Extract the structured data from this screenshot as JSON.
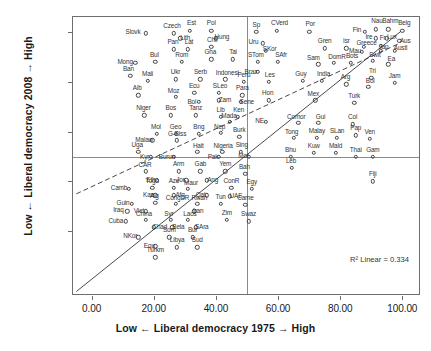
{
  "chart_data": {
    "type": "scatter",
    "title": "",
    "xlabel": "Low ← Liberal democracy 1975 → High",
    "ylabel": "Low ← Liberal democracy 2008 → High",
    "xlim": [
      -6,
      106
    ],
    "ylim": [
      -6,
      106
    ],
    "xticks": [
      "0.00",
      "20.00",
      "40.00",
      "60.00",
      "80.00",
      "100.00"
    ],
    "xtick_values": [
      0,
      20,
      40,
      60,
      80,
      100
    ],
    "yticks": [
      "20.00",
      "40.00",
      "60.00",
      "80.00",
      "100.00"
    ],
    "ytick_values": [
      20,
      40,
      60,
      80,
      100
    ],
    "grid": false,
    "legend": false,
    "annotation": "R² Linear = 0.334",
    "reference_lines": {
      "vertical_x": 50,
      "horizontal_y": 50
    },
    "fit_lines": [
      {
        "name": "identity-line",
        "style": "solid",
        "x1": -5,
        "y1": -5,
        "x2": 100,
        "y2": 100
      },
      {
        "name": "regression-line",
        "style": "dashed",
        "x1": -5,
        "y1": 34.5,
        "x2": 100,
        "y2": 95.5
      }
    ],
    "points": [
      {
        "label": "Slovk",
        "x": 17.5,
        "y": 99.5
      },
      {
        "label": "Czech",
        "x": 26.5,
        "y": 99.5
      },
      {
        "label": "Est",
        "x": 31.5,
        "y": 100.5
      },
      {
        "label": "Lith",
        "x": 28.5,
        "y": 97.5
      },
      {
        "label": "Pol",
        "x": 38.5,
        "y": 100.5
      },
      {
        "label": "Hung",
        "x": 40.0,
        "y": 97.5
      },
      {
        "label": "Sp",
        "x": 53.0,
        "y": 100.0
      },
      {
        "label": "CVerd",
        "x": 59.5,
        "y": 100.5
      },
      {
        "label": "Por",
        "x": 70.0,
        "y": 100.0
      },
      {
        "label": "Fin",
        "x": 88.0,
        "y": 100.0
      },
      {
        "label": "Nau",
        "x": 91.5,
        "y": 101.0
      },
      {
        "label": "Bahm",
        "x": 95.5,
        "y": 101.0
      },
      {
        "label": "Belg",
        "x": 100.0,
        "y": 100.5
      },
      {
        "label": "Ire",
        "x": 91.5,
        "y": 97.5
      },
      {
        "label": "Lux",
        "x": 95.0,
        "y": 97.5
      },
      {
        "label": "Aus",
        "x": 99.0,
        "y": 96.5
      },
      {
        "label": "Uru",
        "x": 55.0,
        "y": 95.5
      },
      {
        "label": "Pan",
        "x": 26.5,
        "y": 93.0
      },
      {
        "label": "Lat",
        "x": 31.0,
        "y": 93.0
      },
      {
        "label": "Chil",
        "x": 38.5,
        "y": 94.0
      },
      {
        "label": "SKor",
        "x": 56.0,
        "y": 92.5
      },
      {
        "label": "Gren",
        "x": 75.0,
        "y": 93.5
      },
      {
        "label": "Isr",
        "x": 82.0,
        "y": 93.5
      },
      {
        "label": "Greece",
        "x": 87.5,
        "y": 94.0
      },
      {
        "label": "Fr",
        "x": 93.0,
        "y": 94.5
      },
      {
        "label": "Mau",
        "x": 87.0,
        "y": 92.0
      },
      {
        "label": "Jap",
        "x": 93.0,
        "y": 92.5
      },
      {
        "label": "Austl",
        "x": 97.5,
        "y": 92.5
      },
      {
        "label": "Mong",
        "x": 14.0,
        "y": 87.5
      },
      {
        "label": "Bul",
        "x": 20.5,
        "y": 88.0
      },
      {
        "label": "Rom",
        "x": 29.0,
        "y": 88.0
      },
      {
        "label": "Gha",
        "x": 38.5,
        "y": 89.0
      },
      {
        "label": "Tai",
        "x": 45.5,
        "y": 89.0
      },
      {
        "label": "STom",
        "x": 53.5,
        "y": 88.0
      },
      {
        "label": "SAfr",
        "x": 60.0,
        "y": 88.0
      },
      {
        "label": "Sam",
        "x": 73.0,
        "y": 87.0
      },
      {
        "label": "DomR",
        "x": 78.0,
        "y": 87.5
      },
      {
        "label": "Bots",
        "x": 83.5,
        "y": 87.5
      },
      {
        "label": "Swit",
        "x": 90.5,
        "y": 88.5
      },
      {
        "label": "Ea",
        "x": 95.5,
        "y": 87.0
      },
      {
        "label": "Ban",
        "x": 12.5,
        "y": 82.5
      },
      {
        "label": "Mali",
        "x": 18.0,
        "y": 80.5
      },
      {
        "label": "Ukr",
        "x": 27.0,
        "y": 81.0
      },
      {
        "label": "Serb",
        "x": 35.0,
        "y": 81.0
      },
      {
        "label": "Indonesi",
        "x": 43.0,
        "y": 81.0
      },
      {
        "label": "Braz",
        "x": 53.5,
        "y": 84.0
      },
      {
        "label": "Peru",
        "x": 49.0,
        "y": 80.0
      },
      {
        "label": "Les",
        "x": 57.0,
        "y": 80.0
      },
      {
        "label": "Guy",
        "x": 68.0,
        "y": 80.5
      },
      {
        "label": "India",
        "x": 74.0,
        "y": 80.5
      },
      {
        "label": "Arg",
        "x": 82.0,
        "y": 79.0
      },
      {
        "label": "Bol",
        "x": 89.0,
        "y": 78.0
      },
      {
        "label": "Tri",
        "x": 90.0,
        "y": 81.5
      },
      {
        "label": "Jam",
        "x": 97.5,
        "y": 79.5
      },
      {
        "label": "Alb",
        "x": 15.0,
        "y": 74.5
      },
      {
        "label": "Moz",
        "x": 27.0,
        "y": 74.0
      },
      {
        "label": "Ecu",
        "x": 33.0,
        "y": 75.5
      },
      {
        "label": "SLeo",
        "x": 41.0,
        "y": 75.5
      },
      {
        "label": "Para",
        "x": 48.5,
        "y": 74.5
      },
      {
        "label": "Bol2",
        "x": 34.5,
        "y": 72.0
      },
      {
        "label": "Zam",
        "x": 41.0,
        "y": 72.5
      },
      {
        "label": "Sene",
        "x": 48.0,
        "y": 72.0
      },
      {
        "label": "Hon",
        "x": 57.0,
        "y": 72.5
      },
      {
        "label": "Mex",
        "x": 72.0,
        "y": 72.5
      },
      {
        "label": "Turk",
        "x": 84.5,
        "y": 71.5
      },
      {
        "label": "Niger",
        "x": 17.0,
        "y": 66.5
      },
      {
        "label": "Bos",
        "x": 25.5,
        "y": 66.5
      },
      {
        "label": "Tanz",
        "x": 33.5,
        "y": 66.5
      },
      {
        "label": "Lib",
        "x": 41.5,
        "y": 66.0
      },
      {
        "label": "Ken",
        "x": 47.0,
        "y": 66.0
      },
      {
        "label": "Mada",
        "x": 44.5,
        "y": 64.0
      },
      {
        "label": "NE",
        "x": 56.0,
        "y": 64.0
      },
      {
        "label": "Comor",
        "x": 66.5,
        "y": 63.5
      },
      {
        "label": "Gui",
        "x": 73.0,
        "y": 63.5
      },
      {
        "label": "Col",
        "x": 84.0,
        "y": 63.0
      },
      {
        "label": "Mol",
        "x": 21.0,
        "y": 59.0
      },
      {
        "label": "Geo",
        "x": 27.0,
        "y": 59.0
      },
      {
        "label": "Bng",
        "x": 34.5,
        "y": 59.0
      },
      {
        "label": "Nep",
        "x": 41.5,
        "y": 59.5
      },
      {
        "label": "Burk",
        "x": 47.5,
        "y": 58.0
      },
      {
        "label": "Malaw",
        "x": 19.5,
        "y": 56.5
      },
      {
        "label": "G-Biss",
        "x": 27.5,
        "y": 56.5
      },
      {
        "label": "Tong",
        "x": 65.0,
        "y": 57.5
      },
      {
        "label": "Malay",
        "x": 72.5,
        "y": 57.5
      },
      {
        "label": "SLan",
        "x": 79.0,
        "y": 57.5
      },
      {
        "label": "Ven",
        "x": 89.5,
        "y": 57.0
      },
      {
        "label": "Pap",
        "x": 85.0,
        "y": 58.5
      },
      {
        "label": "Uga",
        "x": 15.0,
        "y": 52.0
      },
      {
        "label": "Hait",
        "x": 34.0,
        "y": 52.0
      },
      {
        "label": "Nigeria",
        "x": 42.0,
        "y": 52.0
      },
      {
        "label": "Sing",
        "x": 48.0,
        "y": 52.0
      },
      {
        "label": "Kyr",
        "x": 19.0,
        "y": 50.0
      },
      {
        "label": "Burun",
        "x": 26.5,
        "y": 50.0
      },
      {
        "label": "Pak",
        "x": 41.0,
        "y": 50.0
      },
      {
        "label": "Mor",
        "x": 50.5,
        "y": 50.0
      },
      {
        "label": "Bhu",
        "x": 64.0,
        "y": 50.0
      },
      {
        "label": "Kuw",
        "x": 71.5,
        "y": 51.5
      },
      {
        "label": "Mald",
        "x": 78.5,
        "y": 51.5
      },
      {
        "label": "Thai",
        "x": 85.0,
        "y": 50.0
      },
      {
        "label": "Gam",
        "x": 90.5,
        "y": 50.0
      },
      {
        "label": "CAR",
        "x": 17.5,
        "y": 44.0
      },
      {
        "label": "Arm",
        "x": 28.0,
        "y": 44.0
      },
      {
        "label": "Gab",
        "x": 35.0,
        "y": 44.0
      },
      {
        "label": "Yem",
        "x": 43.0,
        "y": 44.0
      },
      {
        "label": "Bah",
        "x": 49.5,
        "y": 43.0
      },
      {
        "label": "Leb",
        "x": 64.5,
        "y": 45.5
      },
      {
        "label": "Eth",
        "x": 21.0,
        "y": 40.5
      },
      {
        "label": "Jor",
        "x": 30.5,
        "y": 40.5
      },
      {
        "label": "Ang",
        "x": 37.0,
        "y": 40.5
      },
      {
        "label": "Fiji",
        "x": 90.5,
        "y": 40.0
      },
      {
        "label": "Camb",
        "x": 12.0,
        "y": 37.0
      },
      {
        "label": "Togo",
        "x": 19.5,
        "y": 37.5
      },
      {
        "label": "Aze",
        "x": 26.5,
        "y": 37.5
      },
      {
        "label": "Maur",
        "x": 31.0,
        "y": 37.0
      },
      {
        "label": "ConR",
        "x": 45.0,
        "y": 37.5
      },
      {
        "label": "Egy",
        "x": 51.5,
        "y": 37.0
      },
      {
        "label": "Kaz",
        "x": 20.5,
        "y": 34.5
      },
      {
        "label": "Afg",
        "x": 26.5,
        "y": 34.5
      },
      {
        "label": "Qat",
        "x": 37.0,
        "y": 34.5
      },
      {
        "label": "UAE",
        "x": 44.5,
        "y": 34.0
      },
      {
        "label": "Guin",
        "x": 13.0,
        "y": 31.0
      },
      {
        "label": "Alg",
        "x": 20.5,
        "y": 31.5
      },
      {
        "label": "CongDR",
        "x": 27.0,
        "y": 31.0
      },
      {
        "label": "Rwan",
        "x": 34.0,
        "y": 31.0
      },
      {
        "label": "Tun",
        "x": 41.5,
        "y": 31.0
      },
      {
        "label": "Came",
        "x": 49.5,
        "y": 30.5
      },
      {
        "label": "Iraq",
        "x": 11.5,
        "y": 28.0
      },
      {
        "label": "Viet",
        "x": 17.5,
        "y": 28.0
      },
      {
        "label": "Iran",
        "x": 33.0,
        "y": 28.0
      },
      {
        "label": "Cuba",
        "x": 11.0,
        "y": 24.0
      },
      {
        "label": "China",
        "x": 17.5,
        "y": 24.5
      },
      {
        "label": "Syr",
        "x": 25.5,
        "y": 24.5
      },
      {
        "label": "Laos",
        "x": 31.0,
        "y": 24.5
      },
      {
        "label": "Zim",
        "x": 43.5,
        "y": 24.5
      },
      {
        "label": "Swaz",
        "x": 50.5,
        "y": 24.0
      },
      {
        "label": "Chad",
        "x": 20.0,
        "y": 21.5
      },
      {
        "label": "Bela",
        "x": 26.0,
        "y": 21.5
      },
      {
        "label": "SAra",
        "x": 33.5,
        "y": 21.5
      },
      {
        "label": "NKor",
        "x": 15.0,
        "y": 17.5
      },
      {
        "label": "Som",
        "x": 25.0,
        "y": 17.5
      },
      {
        "label": "Bur",
        "x": 32.5,
        "y": 17.5
      },
      {
        "label": "Equ",
        "x": 20.5,
        "y": 14.0
      },
      {
        "label": "Libya",
        "x": 27.5,
        "y": 13.5
      },
      {
        "label": "Sud",
        "x": 34.0,
        "y": 13.5
      },
      {
        "label": "Turkm",
        "x": 20.5,
        "y": 9.5
      }
    ],
    "label_offsets": {
      "Slovk": [
        -13,
        -1
      ],
      "Czech": [
        -2,
        -7
      ],
      "Est": [
        2,
        -8
      ],
      "Lith": [
        5,
        0
      ],
      "Pol": [
        0,
        -8
      ],
      "Hung": [
        6,
        -1
      ],
      "Sp": [
        0,
        -7
      ],
      "CVerd": [
        3,
        -8
      ],
      "Por": [
        1,
        -8
      ],
      "Fin": [
        -8,
        -2
      ],
      "Nau": [
        1,
        -8
      ],
      "Bahm": [
        2,
        -8
      ],
      "Belg": [
        2,
        -8
      ],
      "Ire": [
        -7,
        -1
      ],
      "Lux": [
        5,
        -1
      ],
      "Aus": [
        6,
        0
      ],
      "Uru": [
        -9,
        -1
      ],
      "Pan": [
        -1,
        -7
      ],
      "Lat": [
        1,
        -7
      ],
      "Chil": [
        1,
        -7
      ],
      "SKor": [
        4,
        -2
      ],
      "Gren": [
        0,
        -7
      ],
      "Isr": [
        0,
        -7
      ],
      "Greece": [
        3,
        -4
      ],
      "Fr": [
        2,
        -8
      ],
      "Mau": [
        -7,
        -1
      ],
      "Jap": [
        3,
        -4
      ],
      "Austl": [
        6,
        -3
      ],
      "Mong": [
        -10,
        -1
      ],
      "Bul": [
        -1,
        -7
      ],
      "Rom": [
        0,
        -7
      ],
      "Gha": [
        -1,
        -7
      ],
      "Tai": [
        0,
        -7
      ],
      "STom": [
        -2,
        -7
      ],
      "SAfr": [
        3,
        -7
      ],
      "Sam": [
        -5,
        -6
      ],
      "DomR": [
        3,
        -6
      ],
      "Bots": [
        1,
        -7
      ],
      "Swit": [
        2,
        -6
      ],
      "Ea": [
        3,
        -5
      ],
      "Ban": [
        -2,
        -7
      ],
      "Mali": [
        0,
        -7
      ],
      "Ukr": [
        0,
        -7
      ],
      "Serb": [
        0,
        -7
      ],
      "Indonesi": [
        2,
        -6
      ],
      "Braz": [
        -7,
        0
      ],
      "Peru": [
        0,
        -7
      ],
      "Les": [
        1,
        -7
      ],
      "Guy": [
        -2,
        -7
      ],
      "India": [
        2,
        -7
      ],
      "Arg": [
        -1,
        -7
      ],
      "Bol": [
        2,
        -6
      ],
      "Tri": [
        1,
        -7
      ],
      "Jam": [
        0,
        -7
      ],
      "Alb": [
        -1,
        -7
      ],
      "Moz": [
        -2,
        -6
      ],
      "Ecu": [
        0,
        -7
      ],
      "SLeo": [
        1,
        -7
      ],
      "Para": [
        0,
        -7
      ],
      "Bol2": [
        -7,
        0
      ],
      "Zam": [
        6,
        0
      ],
      "Sene": [
        6,
        0
      ],
      "Hon": [
        -1,
        -7
      ],
      "Mex": [
        -2,
        -6
      ],
      "Turk": [
        0,
        -7
      ],
      "Niger": [
        -1,
        -7
      ],
      "Bos": [
        0,
        -7
      ],
      "Tanz": [
        0,
        -7
      ],
      "Lib": [
        0,
        -7
      ],
      "Ken": [
        1,
        -7
      ],
      "Mada": [
        -1,
        -6
      ],
      "NE": [
        -6,
        -1
      ],
      "Comor": [
        -2,
        -6
      ],
      "Gui": [
        2,
        -6
      ],
      "Col": [
        0,
        -7
      ],
      "Mol": [
        -1,
        -7
      ],
      "Geo": [
        0,
        -7
      ],
      "Bng": [
        0,
        -7
      ],
      "Nep": [
        -1,
        -6
      ],
      "Burk": [
        0,
        -7
      ],
      "Malaw": [
        -8,
        0
      ],
      "G-Biss": [
        0,
        -6
      ],
      "Tong": [
        -2,
        -6
      ],
      "Malay": [
        0,
        -7
      ],
      "SLan": [
        0,
        -7
      ],
      "Ven": [
        0,
        -7
      ],
      "Pap": [
        0,
        -7
      ],
      "Uga": [
        -1,
        -7
      ],
      "Hait": [
        1,
        -6
      ],
      "Nigeria": [
        1,
        -6
      ],
      "Sing": [
        1,
        -7
      ],
      "Kyr": [
        -6,
        0
      ],
      "Burun": [
        -7,
        0
      ],
      "Pak": [
        -6,
        0
      ],
      "Mor": [
        -5,
        -1
      ],
      "Bhu": [
        0,
        -7
      ],
      "Kuw": [
        0,
        -7
      ],
      "Mald": [
        0,
        -7
      ],
      "Thai": [
        0,
        -7
      ],
      "Gam": [
        0,
        -7
      ],
      "CAR": [
        -1,
        -6
      ],
      "Arm": [
        0,
        -7
      ],
      "Gab": [
        0,
        -7
      ],
      "Yem": [
        0,
        -7
      ],
      "Bah": [
        -1,
        -7
      ],
      "Leb": [
        -1,
        -7
      ],
      "Eth": [
        -6,
        0
      ],
      "Jor": [
        -6,
        0
      ],
      "Ang": [
        6,
        0
      ],
      "Fiji": [
        0,
        -7
      ],
      "Camb": [
        -10,
        -1
      ],
      "Togo": [
        0,
        -7
      ],
      "Aze": [
        0,
        -7
      ],
      "Maur": [
        3,
        -6
      ],
      "ConR": [
        0,
        -7
      ],
      "Egy": [
        0,
        -7
      ],
      "Kaz": [
        -7,
        0
      ],
      "Afg": [
        6,
        0
      ],
      "Qat": [
        -6,
        0
      ],
      "UAE": [
        6,
        0
      ],
      "Guin": [
        -9,
        -1
      ],
      "Alg": [
        -1,
        -7
      ],
      "CongDR": [
        2,
        -6
      ],
      "Rwan": [
        2,
        -6
      ],
      "Tun": [
        0,
        -7
      ],
      "Came": [
        0,
        -7
      ],
      "Iraq": [
        -9,
        -1
      ],
      "Viet": [
        -7,
        0
      ],
      "Iran": [
        4,
        0
      ],
      "Cuba": [
        -10,
        0
      ],
      "China": [
        -2,
        -6
      ],
      "Syr": [
        -2,
        -6
      ],
      "Laos": [
        2,
        -6
      ],
      "Zim": [
        0,
        -7
      ],
      "Swaz": [
        0,
        -7
      ],
      "Chad": [
        6,
        0
      ],
      "Bela": [
        6,
        0
      ],
      "SAra": [
        6,
        0
      ],
      "NKor": [
        -8,
        -1
      ],
      "Som": [
        0,
        -7
      ],
      "Bur": [
        0,
        -7
      ],
      "Equ": [
        -6,
        0
      ],
      "Libya": [
        0,
        -7
      ],
      "Sud": [
        0,
        -7
      ],
      "Turkm": [
        0,
        -7
      ]
    }
  }
}
